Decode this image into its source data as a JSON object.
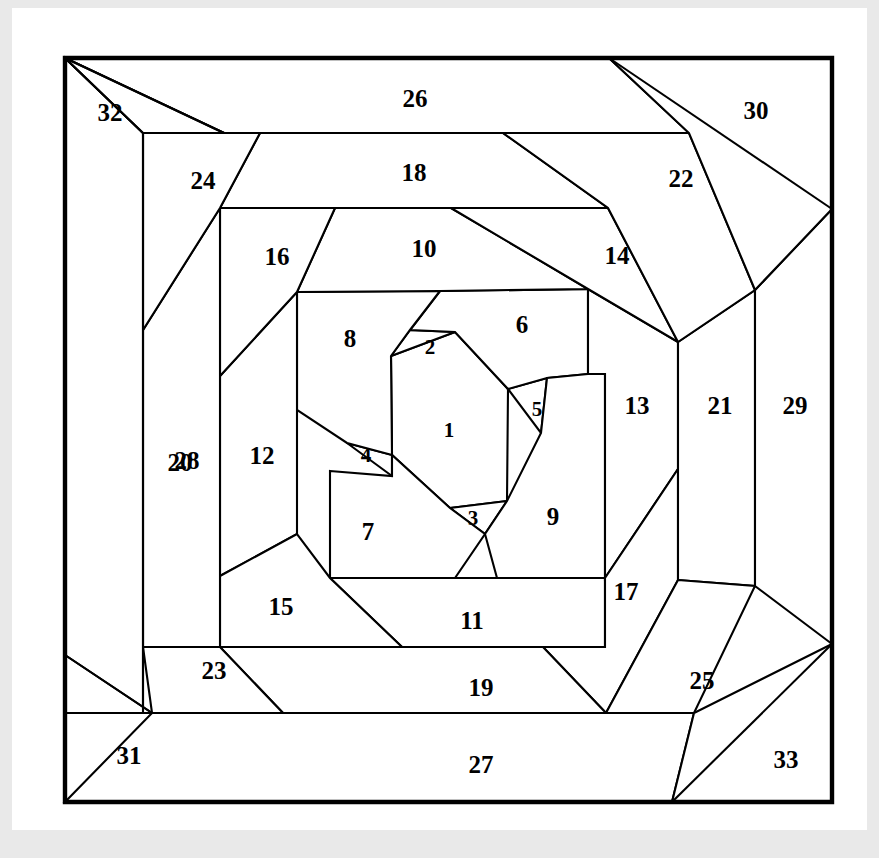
{
  "figure": {
    "kind": "perfect-squared-square-spiral-diagram",
    "piece_count": 33,
    "frame": {
      "x": 65,
      "y": 58,
      "width": 767,
      "height": 744
    },
    "colors": {
      "page_background": "#e9e9e9",
      "paper": "#ffffff",
      "cell_fill": "#ffffff",
      "line": "#000000",
      "label": "#000000"
    },
    "pieces": [
      {
        "id": 1,
        "label": "1",
        "label_x": 449,
        "label_y": 430,
        "points": "391,356 455,332 508,389 507,501 450,508 392,455"
      },
      {
        "id": 2,
        "label": "2",
        "label_x": 430,
        "label_y": 347,
        "points": "410,330 455,332 391,356"
      },
      {
        "id": 3,
        "label": "3",
        "label_x": 473,
        "label_y": 518,
        "points": "450,508 507,501 485,534"
      },
      {
        "id": 4,
        "label": "4",
        "label_x": 366,
        "label_y": 455,
        "points": "392,455 392,476 347,443"
      },
      {
        "id": 5,
        "label": "5",
        "label_x": 537,
        "label_y": 409,
        "points": "508,389 547,378 541,433"
      },
      {
        "id": 6,
        "label": "6",
        "label_x": 522,
        "label_y": 324,
        "points": "440,291 588,289 588,374 547,378 508,389 455,332 410,330"
      },
      {
        "id": 7,
        "label": "7",
        "label_x": 368,
        "label_y": 531,
        "points": "330,471 392,476 392,455 450,508 485,534 455,578 330,578"
      },
      {
        "id": 8,
        "label": "8",
        "label_x": 350,
        "label_y": 338,
        "points": "297,292 440,291 410,330 391,356 392,455 347,443 297,410"
      },
      {
        "id": 9,
        "label": "9",
        "label_x": 553,
        "label_y": 516,
        "points": "547,378 588,374 605,374 605,578 497,578 485,534 507,501 541,433"
      },
      {
        "id": 10,
        "label": "10",
        "label_x": 424,
        "label_y": 248,
        "points": "335,208 451,208 588,289 440,291 297,292"
      },
      {
        "id": 11,
        "label": "11",
        "label_x": 472,
        "label_y": 620,
        "points": "330,578 455,578 497,578 605,578 605,647 402,647"
      },
      {
        "id": 12,
        "label": "12",
        "label_x": 262,
        "label_y": 455,
        "points": "220,376 297,292 297,410 297,534 220,576"
      },
      {
        "id": 13,
        "label": "13",
        "label_x": 637,
        "label_y": 405,
        "points": "588,289 678,342 678,469 605,578 605,374 588,374"
      },
      {
        "id": 14,
        "label": "14",
        "label_x": 617,
        "label_y": 255,
        "points": "451,208 608,208 678,342 588,289"
      },
      {
        "id": 15,
        "label": "15",
        "label_x": 281,
        "label_y": 606,
        "points": "220,576 297,534 330,578 402,647 220,647"
      },
      {
        "id": 16,
        "label": "16",
        "label_x": 277,
        "label_y": 256,
        "points": "220,208 335,208 297,292 220,376"
      },
      {
        "id": 17,
        "label": "17",
        "label_x": 626,
        "label_y": 591,
        "points": "678,469 678,580 606,713 543,647 605,647 605,578"
      },
      {
        "id": 18,
        "label": "18",
        "label_x": 414,
        "label_y": 172,
        "points": "260,133 503,133 608,208 451,208 335,208 220,208"
      },
      {
        "id": 19,
        "label": "19",
        "label_x": 481,
        "label_y": 687,
        "points": "220,647 402,647 543,647 606,713 283,713"
      },
      {
        "id": 20,
        "label": "20",
        "label_x": 180,
        "label_y": 462,
        "points": "143,330 220,208 220,376 220,576 220,647 143,647"
      },
      {
        "id": 21,
        "label": "21",
        "label_x": 720,
        "label_y": 405,
        "points": "678,342 755,290 755,586 678,580 678,469"
      },
      {
        "id": 22,
        "label": "22",
        "label_x": 681,
        "label_y": 178,
        "points": "503,133 689,133 755,290 678,342 608,208"
      },
      {
        "id": 23,
        "label": "23",
        "label_x": 214,
        "label_y": 670,
        "points": "143,647 220,647 283,713 152,713"
      },
      {
        "id": 24,
        "label": "24",
        "label_x": 203,
        "label_y": 180,
        "points": "143,133 224,133 260,133 220,208 143,330"
      },
      {
        "id": 25,
        "label": "25",
        "label_x": 702,
        "label_y": 680,
        "points": "606,713 678,580 755,586 694,713"
      },
      {
        "id": 26,
        "label": "26",
        "label_x": 415,
        "label_y": 98,
        "points": "65,58 609,58 689,133 503,133 260,133 224,133"
      },
      {
        "id": 27,
        "label": "27",
        "label_x": 481,
        "label_y": 764,
        "points": "152,713 283,713 606,713 694,713 672,802 65,802"
      },
      {
        "id": 28,
        "label": "28",
        "label_x": 187,
        "label_y": 460,
        "points": "65,58 143,133 143,330 143,647 143,713 65,713"
      },
      {
        "id": 29,
        "label": "29",
        "label_x": 795,
        "label_y": 405,
        "points": "755,290 832,209 832,644 755,586"
      },
      {
        "id": 30,
        "label": "30",
        "label_x": 756,
        "label_y": 110,
        "points": "609,58 832,58 832,209 755,290 689,133"
      },
      {
        "id": 31,
        "label": "31",
        "label_x": 129,
        "label_y": 755,
        "points": "65,655 152,713 65,713"
      },
      {
        "id": 32,
        "label": "32",
        "label_x": 110,
        "label_y": 112,
        "points": "65,58 224,133 143,133"
      },
      {
        "id": 33,
        "label": "33",
        "label_x": 786,
        "label_y": 759,
        "points": "832,644 832,802 672,802 694,713"
      }
    ],
    "frame_outline": "65,58 832,58 832,802 65,802",
    "extra_lines": [
      {
        "name": "outer-diag-top-left",
        "x1": 65,
        "y1": 58,
        "x2": 224,
        "y2": 133
      },
      {
        "name": "outer-diag-left-upper",
        "x1": 65,
        "y1": 58,
        "x2": 143,
        "y2": 133
      },
      {
        "name": "left-vertical-28-20",
        "x1": 143,
        "y1": 133,
        "x2": 143,
        "y2": 713
      },
      {
        "name": "outer-diag-left-lower",
        "x1": 65,
        "y1": 655,
        "x2": 152,
        "y2": 713
      },
      {
        "name": "bottom-band-27",
        "x1": 152,
        "y1": 713,
        "x2": 694,
        "y2": 713
      },
      {
        "name": "outer-diag-bottom-right",
        "x1": 672,
        "y1": 802,
        "x2": 832,
        "y2": 644
      },
      {
        "name": "right-vertical-29",
        "x1": 832,
        "y1": 209,
        "x2": 832,
        "y2": 644
      },
      {
        "name": "outer-diag-top-right",
        "x1": 609,
        "y1": 58,
        "x2": 832,
        "y2": 209
      }
    ]
  }
}
